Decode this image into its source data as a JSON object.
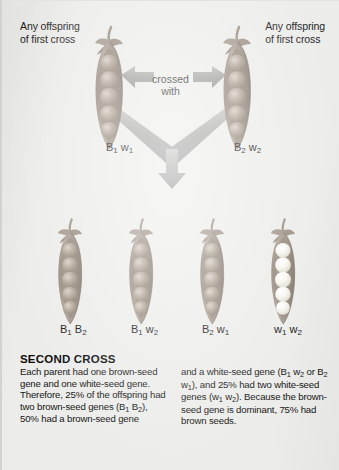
{
  "figure": {
    "background_color": "#ececea",
    "pod_brown_color": "#9b8e7e",
    "pod_white_color": "#f4f2ec",
    "arrow_color": "#9e9e9c",
    "text_color": "#151515"
  },
  "parents": {
    "left": {
      "caption": "Any offspring\nof first cross",
      "genotype_allele1": "B",
      "genotype_sub1": "1",
      "genotype_allele2": "w",
      "genotype_sub2": "1",
      "seed_color": "brown",
      "pea_count": 5
    },
    "right": {
      "caption": "Any offspring\nof first cross",
      "genotype_allele1": "B",
      "genotype_sub1": "2",
      "genotype_allele2": "w",
      "genotype_sub2": "2",
      "seed_color": "brown",
      "pea_count": 5
    },
    "cross_label": "crossed\nwith"
  },
  "offspring": [
    {
      "genotype_allele1": "B",
      "genotype_sub1": "1",
      "genotype_allele2": "B",
      "genotype_sub2": "2",
      "seed_color": "brown",
      "pea_count": 5
    },
    {
      "genotype_allele1": "B",
      "genotype_sub1": "1",
      "genotype_allele2": "w",
      "genotype_sub2": "2",
      "seed_color": "brown",
      "pea_count": 5
    },
    {
      "genotype_allele1": "B",
      "genotype_sub1": "2",
      "genotype_allele2": "w",
      "genotype_sub2": "1",
      "seed_color": "brown",
      "pea_count": 5
    },
    {
      "genotype_allele1": "w",
      "genotype_sub1": "1",
      "genotype_allele2": "w",
      "genotype_sub2": "2",
      "seed_color": "white",
      "pea_count": 5
    }
  ],
  "caption_block": {
    "title": "SECOND CROSS",
    "column_left_part1": "Each parent had one brown-seed gene and one white-seed gene. Therefore, 25% of the offspring had two brown-seed genes (B",
    "column_left_sub1": "1",
    "column_left_part2": " B",
    "column_left_sub2": "2",
    "column_left_part3": "), 50% had a brown-seed gene",
    "column_right_part1": "and a white-seed gene (B",
    "column_right_sub1": "1",
    "column_right_part2": " w",
    "column_right_sub2": "2",
    "column_right_part3": " or B",
    "column_right_sub3": "2",
    "column_right_part4": " w",
    "column_right_sub4": "1",
    "column_right_part5": "), and 25% had two white-seed genes (w",
    "column_right_sub5": "1",
    "column_right_part6": " w",
    "column_right_sub6": "2",
    "column_right_part7": "). Because the brown-seed gene is dominant, 75% had brown seeds."
  }
}
